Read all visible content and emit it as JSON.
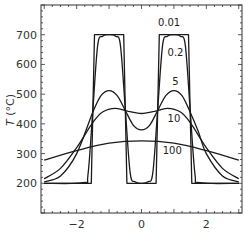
{
  "chart_data": {
    "type": "line",
    "title": "",
    "xlabel": "",
    "ylabel": "T (°C)",
    "ylabel_italic": "T",
    "ylabel_unit": " (°C)",
    "xlim": [
      -3.1,
      3.1
    ],
    "ylim": [
      100,
      800
    ],
    "x_ticks": [
      -2,
      0,
      2
    ],
    "x_tick_labels": [
      "−2",
      "0",
      "2"
    ],
    "y_ticks": [
      200,
      300,
      400,
      500,
      600,
      700
    ],
    "y_tick_labels": [
      "200",
      "300",
      "400",
      "500",
      "600",
      "700"
    ],
    "grid": false,
    "legend": "inline curve labels",
    "line_color": "#1a1a1a",
    "series": [
      {
        "name": "0.01",
        "label_pos": {
          "x": 0.85,
          "y": 730
        },
        "x": [
          -3.0,
          -1.55,
          -1.5,
          -1.45,
          -0.55,
          -0.5,
          -0.45,
          0.45,
          0.5,
          0.55,
          1.45,
          1.5,
          1.55,
          3.0
        ],
        "y": [
          200,
          200,
          450,
          700,
          700,
          450,
          200,
          200,
          450,
          700,
          700,
          450,
          200,
          200
        ]
      },
      {
        "name": "0.2",
        "label_pos": {
          "x": 1.05,
          "y": 630
        },
        "x": [
          -3.0,
          -1.8,
          -1.65,
          -1.5,
          -1.35,
          -1.2,
          -1.0,
          -0.8,
          -0.65,
          -0.5,
          -0.35,
          -0.2,
          0.0,
          0.2,
          0.35,
          0.5,
          0.65,
          0.8,
          1.0,
          1.2,
          1.35,
          1.5,
          1.65,
          1.8,
          3.0
        ],
        "y": [
          200,
          202,
          230,
          450,
          665,
          695,
          700,
          695,
          665,
          450,
          235,
          205,
          200,
          205,
          235,
          450,
          665,
          695,
          700,
          695,
          665,
          450,
          230,
          202,
          200
        ]
      },
      {
        "name": "5",
        "label_pos": {
          "x": 1.05,
          "y": 530
        },
        "x": [
          -3.0,
          -2.5,
          -2.0,
          -1.5,
          -1.25,
          -1.0,
          -0.75,
          -0.5,
          -0.25,
          0.0,
          0.25,
          0.5,
          0.75,
          1.0,
          1.25,
          1.5,
          1.75,
          2.0,
          2.5,
          3.0
        ],
        "y": [
          205,
          225,
          300,
          440,
          495,
          512,
          495,
          445,
          395,
          380,
          395,
          445,
          495,
          512,
          495,
          440,
          375,
          300,
          225,
          205
        ]
      },
      {
        "name": "10",
        "label_pos": {
          "x": 1.0,
          "y": 405
        },
        "x": [
          -3.0,
          -2.5,
          -2.0,
          -1.5,
          -1.2,
          -0.8,
          -0.4,
          0.0,
          0.4,
          0.8,
          1.2,
          1.5,
          2.0,
          2.5,
          3.0
        ],
        "y": [
          215,
          250,
          320,
          405,
          440,
          452,
          442,
          435,
          442,
          452,
          440,
          405,
          320,
          250,
          215
        ]
      },
      {
        "name": "100",
        "label_pos": {
          "x": 0.95,
          "y": 300
        },
        "x": [
          -3.0,
          -2.0,
          -1.0,
          0.0,
          1.0,
          2.0,
          3.0
        ],
        "y": [
          278,
          310,
          335,
          343,
          335,
          310,
          278
        ]
      }
    ]
  }
}
